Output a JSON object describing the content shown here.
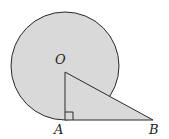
{
  "diagram": {
    "type": "geometry",
    "colors": {
      "fill": "#d9d9d9",
      "stroke": "#2a2a2a",
      "background": "#ffffff"
    },
    "circle": {
      "center": "O",
      "cx": 65,
      "cy": 66,
      "r": 54
    },
    "points": {
      "O": {
        "label": "O",
        "x": 65,
        "y": 66
      },
      "A": {
        "label": "A",
        "x": 65,
        "y": 120
      },
      "B": {
        "label": "B",
        "x": 153,
        "y": 120
      }
    },
    "labels": {
      "O": "O",
      "A": "A",
      "B": "B"
    },
    "right_angle_at": "A"
  }
}
